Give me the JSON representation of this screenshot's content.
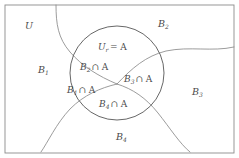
{
  "diagram": {
    "frame": {
      "x": 5,
      "y": 5,
      "width": 229,
      "height": 148,
      "stroke": "#8c8c8c"
    },
    "colors": {
      "background": "#ffffff",
      "frame_stroke": "#8c8c8c",
      "curve_stroke": "#8a8a8a",
      "circle_stroke": "#5f5f5f",
      "text": "#4a4a4a"
    },
    "circle": {
      "name": "set-a-circle",
      "cx": 117,
      "cy": 73,
      "r": 47
    },
    "outer_labels": [
      {
        "id": "u",
        "base": "U",
        "sub": "",
        "x": 25,
        "y": 26
      },
      {
        "id": "b2",
        "base": "B",
        "sub": "2",
        "x": 158,
        "y": 24
      },
      {
        "id": "b1",
        "base": "B",
        "sub": "1",
        "x": 38,
        "y": 70
      },
      {
        "id": "b3",
        "base": "B",
        "sub": "3",
        "x": 192,
        "y": 92
      },
      {
        "id": "b4",
        "base": "B",
        "sub": "4",
        "x": 116,
        "y": 137
      }
    ],
    "inner_labels": [
      {
        "id": "ur-eq-a",
        "base": "U",
        "sub": "r",
        "op": "= A",
        "x": 98,
        "y": 47
      },
      {
        "id": "b2-cap-a",
        "base": "B",
        "sub": "2",
        "op": "∩ A",
        "x": 80,
        "y": 67
      },
      {
        "id": "b3-cap-a",
        "base": "B",
        "sub": "3",
        "op": "∩ A",
        "x": 124,
        "y": 79
      },
      {
        "id": "b1-cap-a",
        "base": "B",
        "sub": "1",
        "op": "∩ A",
        "x": 67,
        "y": 90
      },
      {
        "id": "b4-cap-a",
        "base": "B",
        "sub": "4",
        "op": "∩ A",
        "x": 99,
        "y": 104
      }
    ],
    "curves": [
      {
        "id": "curve-b1-b2",
        "desc": "upper-left boundary separating B1 from B2, from top frame edge down to center point",
        "d": "M 56 5 C 56 24, 58 38, 70 52 C 82 66, 98 76, 117 84"
      },
      {
        "id": "curve-b2-b3",
        "desc": "boundary separating B2 from B3, from center point out to right frame edge",
        "d": "M 117 84 C 132 68, 146 56, 166 51 C 190 46, 212 52, 234 47"
      },
      {
        "id": "curve-b1-b4",
        "desc": "boundary separating B1 from B4, from center point sweeping down-left to bottom frame edge",
        "d": "M 117 84 C 100 88, 84 95, 70 109 C 56 124, 48 142, 41 152"
      },
      {
        "id": "curve-b3-b4",
        "desc": "boundary separating B3 from B4, from center point sweeping down-right to bottom frame edge",
        "d": "M 117 84 C 133 89, 146 98, 158 113 C 170 128, 180 144, 190 152"
      }
    ]
  }
}
